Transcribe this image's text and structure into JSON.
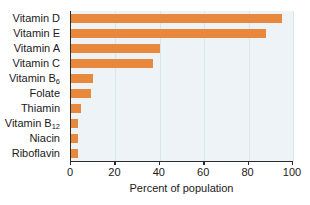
{
  "chart_data": {
    "type": "bar",
    "orientation": "horizontal",
    "title": "",
    "xlabel": "Percent of population",
    "ylabel": "",
    "xlim": [
      0,
      100
    ],
    "xticks": [
      0,
      20,
      40,
      60,
      80,
      100
    ],
    "grid": true,
    "grid_axis": "x",
    "legend": null,
    "categories": [
      "Vitamin D",
      "Vitamin E",
      "Vitamin A",
      "Vitamin C",
      "Vitamin B6",
      "Folate",
      "Thiamin",
      "Vitamin B12",
      "Niacin",
      "Riboflavin"
    ],
    "category_labels_html": [
      "Vitamin D",
      "Vitamin E",
      "Vitamin A",
      "Vitamin C",
      "Vitamin B<sub>6</sub>",
      "Folate",
      "Thiamin",
      "Vitamin B<sub>12</sub>",
      "Niacin",
      "Riboflavin"
    ],
    "values": [
      95,
      88,
      40,
      37,
      10,
      9,
      4.5,
      3,
      3,
      3
    ],
    "bar_color": "#e8883c",
    "plot_background": "#edf3f6",
    "page_background": "#ffffff",
    "axis_color": "#2b2b2b",
    "gridline_color": "#dbe6ec",
    "text_color": "#1a1a1a"
  },
  "axis": {
    "x_title": "Percent of population",
    "tick_labels": [
      "0",
      "20",
      "40",
      "60",
      "80",
      "100"
    ]
  }
}
